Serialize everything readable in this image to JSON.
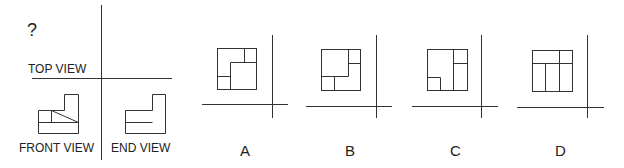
{
  "problem": {
    "question_mark": "?",
    "labels": {
      "top_view": "TOP VIEW",
      "front_view": "FRONT VIEW",
      "end_view": "END VIEW"
    }
  },
  "options": [
    {
      "label": "A"
    },
    {
      "label": "B"
    },
    {
      "label": "C"
    },
    {
      "label": "D"
    }
  ],
  "colors": {
    "line": "#333333",
    "hidden_line": "#bbbbbb",
    "background": "#ffffff"
  }
}
